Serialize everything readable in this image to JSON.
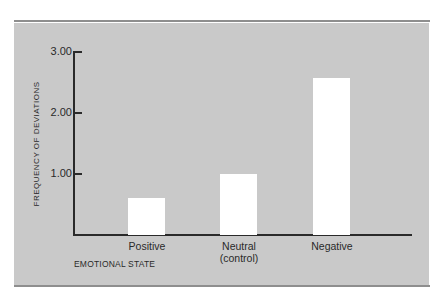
{
  "chart_data": {
    "type": "bar",
    "title": "",
    "categories": [
      "Positive",
      "Neutral (control)",
      "Negative"
    ],
    "category_labels": [
      {
        "line1": "Positive",
        "line2": ""
      },
      {
        "line1": "Neutral",
        "line2": "(control)"
      },
      {
        "line1": "Negative",
        "line2": ""
      }
    ],
    "values": [
      0.6,
      1.0,
      2.56
    ],
    "xlabel": "EMOTIONAL STATE",
    "ylabel": "FREQUENCY OF DEVIATIONS",
    "yticks": [
      "1.00",
      "2.00",
      "3.00"
    ],
    "ylim": [
      0,
      3.0
    ],
    "grid": false,
    "legend": null,
    "colors": {
      "background": "#c9c9c9",
      "bar": "#ffffff",
      "axis": "#2a2a2a"
    }
  }
}
